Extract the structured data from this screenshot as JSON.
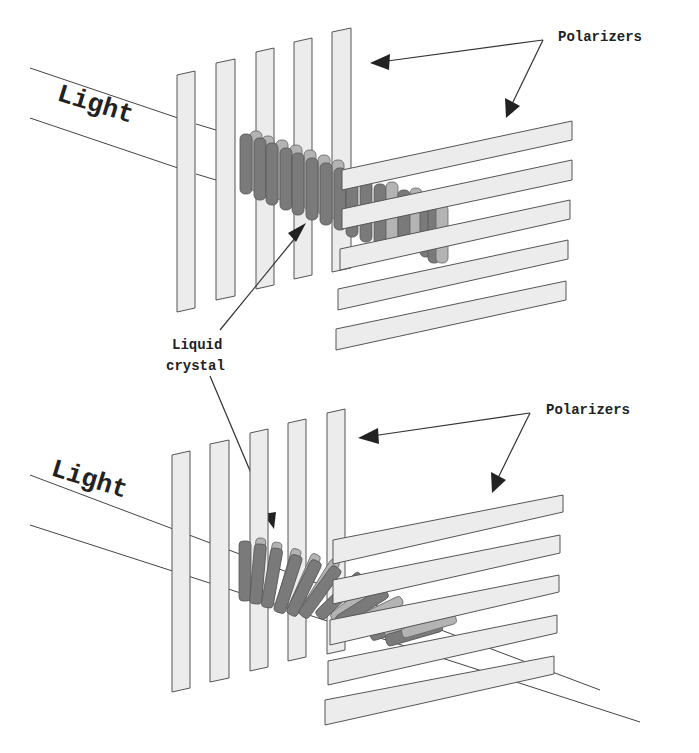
{
  "diagram": {
    "panels": [
      {
        "id": "top",
        "state": "twisted liquid crystal",
        "labels": {
          "light": "Light",
          "polarizers": "Polarizers"
        }
      },
      {
        "id": "bottom",
        "state": "untwisted / tilted liquid crystal, light passes through",
        "labels": {
          "light": "Light",
          "polarizers": "Polarizers"
        }
      }
    ],
    "shared_labels": {
      "liquid_crystal_line1": "Liquid",
      "liquid_crystal_line2": "crystal"
    },
    "colors": {
      "polarizer_fill": "#ececec",
      "polarizer_stroke": "#555555",
      "crystal_dark": "#7a7a7a",
      "crystal_light": "#b3b3b3",
      "background": "#ffffff"
    }
  }
}
